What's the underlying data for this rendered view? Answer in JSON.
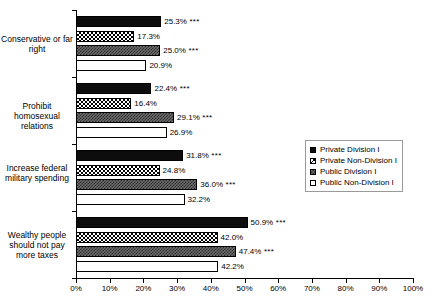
{
  "chart_data": {
    "type": "bar",
    "orientation": "horizontal",
    "title": "",
    "xlabel": "",
    "ylabel": "",
    "xlim": [
      0,
      100
    ],
    "grid": false,
    "legend_position": "middle-right",
    "xticks": [
      "0%",
      "10%",
      "20%",
      "30%",
      "40%",
      "50%",
      "60%",
      "70%",
      "80%",
      "90%",
      "100%"
    ],
    "xtick_values": [
      0,
      10,
      20,
      30,
      40,
      50,
      60,
      70,
      80,
      90,
      100
    ],
    "categories": [
      "Conservative or far right",
      "Prohibit homosexual relations",
      "Increase federal military spending",
      "Wealthy people should not pay more taxes"
    ],
    "series": [
      {
        "name": "Private Division I",
        "pattern": "solid-black",
        "values": [
          25.3,
          22.4,
          31.8,
          50.9
        ],
        "labels": [
          "25.3%",
          "22.4%",
          "31.8%",
          "50.9%"
        ],
        "significance": [
          "***",
          "***",
          "***",
          "***"
        ]
      },
      {
        "name": "Private Non-Division I",
        "pattern": "checkered",
        "values": [
          17.3,
          16.4,
          24.8,
          42.0
        ],
        "labels": [
          "17.3%",
          "16.4%",
          "24.8%",
          "42.0%"
        ],
        "significance": [
          "",
          "",
          "",
          ""
        ]
      },
      {
        "name": "Public Division I",
        "pattern": "gray-speckled",
        "values": [
          25.0,
          29.1,
          36.0,
          47.4
        ],
        "labels": [
          "25.0%",
          "29.1%",
          "36.0%",
          "47.4%"
        ],
        "significance": [
          "***",
          "***",
          "***",
          "***"
        ]
      },
      {
        "name": "Public Non-Division I",
        "pattern": "white-outline",
        "values": [
          20.9,
          26.9,
          32.2,
          42.2
        ],
        "labels": [
          "20.9%",
          "26.9%",
          "32.2%",
          "42.2%"
        ],
        "significance": [
          "",
          "",
          "",
          ""
        ]
      }
    ]
  },
  "legend": {
    "items": [
      {
        "label": "Private Division I",
        "pattern": "solid-black"
      },
      {
        "label": "Private Non-Division I",
        "pattern": "checkered"
      },
      {
        "label": "Public Division I",
        "pattern": "gray-speckled"
      },
      {
        "label": "Public Non-Division I",
        "pattern": "white-outline"
      }
    ]
  },
  "colors": {
    "series_1": "#0d0d0d",
    "series_2": "#ffffff",
    "series_3": "#6e6e6e",
    "series_4": "#ffffff",
    "axis": "#000000",
    "background": "#ffffff"
  }
}
